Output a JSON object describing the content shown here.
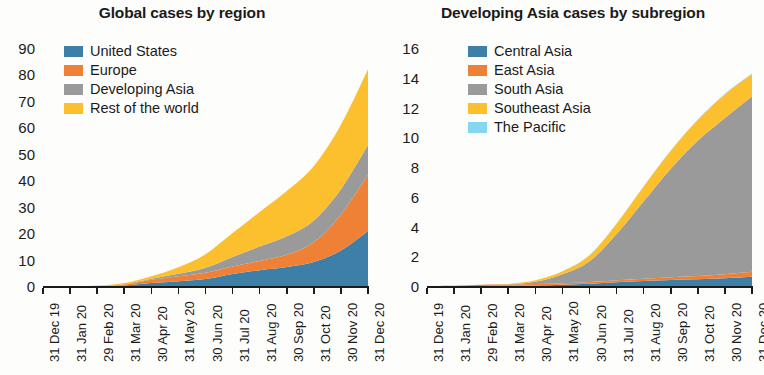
{
  "chart_data": [
    {
      "type": "area",
      "title": "Global cases by region",
      "xlabel": "",
      "ylabel": "",
      "stacked": true,
      "grid": false,
      "legend_position": "top-left-inside",
      "ylim": [
        0,
        90
      ],
      "yticks": [
        0,
        10,
        20,
        30,
        40,
        50,
        60,
        70,
        80,
        90
      ],
      "ytick_labels": [
        "0",
        "10",
        "20",
        "30",
        "40",
        "50",
        "60",
        "70",
        "80",
        "90"
      ],
      "categories": [
        "31 Dec 19",
        "31 Jan 20",
        "29 Feb 20",
        "31 Mar 20",
        "30 Apr 20",
        "31 May 20",
        "30 Jun 20",
        "31 Jul 20",
        "31 Aug 20",
        "30 Sep 20",
        "31 Oct 20",
        "30 Nov 20",
        "31 Dec 20"
      ],
      "series": [
        {
          "name": "United States",
          "color": "#3e7fa8",
          "values": [
            0,
            0,
            0,
            0.2,
            1.1,
            1.8,
            2.6,
            4.5,
            6.0,
            7.2,
            9.1,
            13.4,
            20.8
          ]
        },
        {
          "name": "Europe",
          "color": "#ef8136",
          "values": [
            0,
            0,
            0,
            0.4,
            1.3,
            1.9,
            2.4,
            2.9,
            3.5,
            4.6,
            7.4,
            13.6,
            21.3
          ]
        },
        {
          "name": "Developing Asia",
          "color": "#9a9a9a",
          "values": [
            0,
            0.01,
            0.08,
            0.1,
            0.3,
            0.9,
            1.9,
            3.6,
            5.4,
            7.0,
            8.3,
            9.6,
            11.2
          ]
        },
        {
          "name": "Rest of the world",
          "color": "#fcbf2e",
          "values": [
            0,
            0.01,
            0.02,
            0.4,
            1.0,
            2.5,
            5.1,
            9.0,
            13.1,
            17.1,
            20.6,
            24.4,
            28.7
          ]
        }
      ],
      "totals": [
        0,
        0.02,
        0.1,
        1.1,
        3.7,
        7.1,
        12.0,
        20.0,
        28.0,
        35.9,
        45.4,
        61.0,
        82.0
      ]
    },
    {
      "type": "area",
      "title": "Developing Asia cases by subregion",
      "xlabel": "",
      "ylabel": "",
      "stacked": true,
      "grid": false,
      "legend_position": "top-left-inside",
      "ylim": [
        0,
        16
      ],
      "yticks": [
        0,
        2,
        4,
        6,
        8,
        10,
        12,
        14,
        16
      ],
      "ytick_labels": [
        "0",
        "2",
        "4",
        "6",
        "8",
        "10",
        "12",
        "14",
        "16"
      ],
      "categories": [
        "31 Dec 19",
        "31 Jan 20",
        "29 Feb 20",
        "31 Mar 20",
        "30 Apr 20",
        "31 May 20",
        "30 Jun 20",
        "31 Jul 20",
        "31 Aug 20",
        "30 Sep 20",
        "31 Oct 20",
        "30 Nov 20",
        "31 Dec 20"
      ],
      "series": [
        {
          "name": "Central Asia",
          "color": "#3e7fa8",
          "values": [
            0,
            0,
            0,
            0.01,
            0.03,
            0.08,
            0.15,
            0.25,
            0.33,
            0.4,
            0.45,
            0.52,
            0.62
          ]
        },
        {
          "name": "East Asia",
          "color": "#ef8136",
          "values": [
            0,
            0.01,
            0.08,
            0.09,
            0.1,
            0.11,
            0.12,
            0.14,
            0.16,
            0.19,
            0.22,
            0.27,
            0.33
          ]
        },
        {
          "name": "South Asia",
          "color": "#9a9a9a",
          "values": [
            0,
            0,
            0,
            0.01,
            0.15,
            0.6,
            1.4,
            3.1,
            5.2,
            7.3,
            9.1,
            10.5,
            11.8
          ]
        },
        {
          "name": "Southeast Asia",
          "color": "#fcbf2e",
          "values": [
            0,
            0,
            0.01,
            0.03,
            0.1,
            0.2,
            0.4,
            0.7,
            1.0,
            1.2,
            1.4,
            1.6,
            1.5
          ]
        },
        {
          "name": "The Pacific",
          "color": "#87d6ef",
          "values": [
            0,
            0,
            0,
            0,
            0.01,
            0.01,
            0.01,
            0.01,
            0.02,
            0.02,
            0.02,
            0.03,
            0.03
          ]
        }
      ],
      "totals": [
        0,
        0.01,
        0.09,
        0.14,
        0.39,
        1.0,
        2.08,
        4.2,
        6.71,
        9.11,
        11.19,
        12.92,
        14.28
      ]
    }
  ]
}
